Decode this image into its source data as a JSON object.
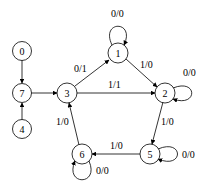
{
  "diagram": {
    "type": "state-machine",
    "nodes": [
      {
        "id": "0",
        "label": "0",
        "x": 22,
        "y": 51
      },
      {
        "id": "7",
        "label": "7",
        "x": 22,
        "y": 93
      },
      {
        "id": "4",
        "label": "4",
        "x": 22,
        "y": 129
      },
      {
        "id": "3",
        "label": "3",
        "x": 67,
        "y": 93
      },
      {
        "id": "1",
        "label": "1",
        "x": 118,
        "y": 53
      },
      {
        "id": "2",
        "label": "2",
        "x": 165,
        "y": 93
      },
      {
        "id": "5",
        "label": "5",
        "x": 150,
        "y": 154
      },
      {
        "id": "6",
        "label": "6",
        "x": 82,
        "y": 154
      }
    ],
    "edges": [
      {
        "from": "0",
        "to": "7",
        "label": ""
      },
      {
        "from": "4",
        "to": "7",
        "label": ""
      },
      {
        "from": "7",
        "to": "3",
        "label": ""
      },
      {
        "from": "3",
        "to": "1",
        "label": "0/1"
      },
      {
        "from": "3",
        "to": "2",
        "label": "1/1"
      },
      {
        "from": "1",
        "to": "1",
        "label": "0/0"
      },
      {
        "from": "1",
        "to": "2",
        "label": "1/0"
      },
      {
        "from": "2",
        "to": "2",
        "label": "0/0"
      },
      {
        "from": "2",
        "to": "5",
        "label": "1/0"
      },
      {
        "from": "5",
        "to": "5",
        "label": "0/0"
      },
      {
        "from": "5",
        "to": "6",
        "label": "1/0"
      },
      {
        "from": "6",
        "to": "6",
        "label": "0/0"
      },
      {
        "from": "6",
        "to": "3",
        "label": "1/0"
      }
    ]
  }
}
